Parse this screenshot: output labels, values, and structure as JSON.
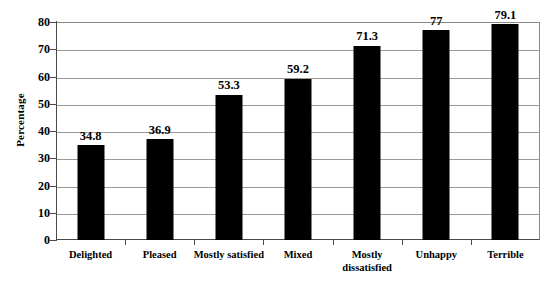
{
  "chart_data": {
    "type": "bar",
    "title": "",
    "xlabel": "",
    "ylabel": "Percentage",
    "categories": [
      "Delighted",
      "Pleased",
      "Mostly satisfied",
      "Mixed",
      "Mostly\ndissatisfied",
      "Unhappy",
      "Terrible"
    ],
    "values": [
      34.8,
      36.9,
      53.3,
      59.2,
      71.3,
      77,
      79.1
    ],
    "value_labels": [
      "34.8",
      "36.9",
      "53.3",
      "59.2",
      "71.3",
      "77",
      "79.1"
    ],
    "ylim": [
      0,
      80
    ],
    "ytick_values": [
      0,
      10,
      20,
      30,
      40,
      50,
      60,
      70,
      80
    ],
    "ytick_labels": [
      "0",
      "10",
      "20",
      "30",
      "40",
      "50",
      "60",
      "70",
      "80"
    ],
    "grid": true,
    "legend": false,
    "legend_position": "none",
    "bar_color": "#000000",
    "gridline_color": "#9a9a9a",
    "axis_color": "#4a4a4a",
    "background_color": "#ffffff"
  }
}
